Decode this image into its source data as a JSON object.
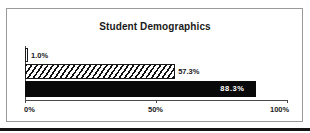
{
  "chart_data": {
    "type": "bar",
    "orientation": "horizontal",
    "title": "Student Demographics",
    "xlabel": "",
    "ylabel": "",
    "xlim": [
      0,
      100
    ],
    "grid": false,
    "legend": false,
    "categories": [
      "series-1",
      "series-2",
      "series-3"
    ],
    "values": [
      1.0,
      57.3,
      88.3
    ],
    "bar_labels": [
      "1.0%",
      "57.3%",
      "88.3%"
    ],
    "bar_styles": [
      "white-outline",
      "diagonal-hatch",
      "solid-black"
    ],
    "axis_ticks": [
      {
        "value": 0,
        "label": "0%"
      },
      {
        "value": 50,
        "label": "50%"
      },
      {
        "value": 100,
        "label": "100%"
      }
    ]
  },
  "colors": {
    "frame": "#9a9a9a",
    "axis": "#4a4a4a",
    "bar_solid": "#090909",
    "bar_outline": "#1a1a1a",
    "text": "#1a1a1a",
    "text_inverse": "#ffffff",
    "bottom_rule": "#141414",
    "background": "#ffffff"
  }
}
